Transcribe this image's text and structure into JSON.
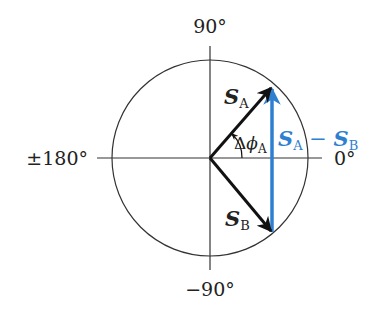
{
  "axes": {
    "top_label": "90°",
    "bottom_label": "−90°",
    "left_label": "±180°",
    "right_label": "0°"
  },
  "vectors": {
    "a": {
      "symbol": "S",
      "subscript": "A",
      "color": "#111111"
    },
    "b": {
      "symbol": "S",
      "subscript": "B",
      "color": "#111111"
    },
    "difference": {
      "symbol_1": "S",
      "subscript_1": "A",
      "operator": " − ",
      "symbol_2": "S",
      "subscript_2": "B",
      "color": "#2f7fd0"
    }
  },
  "angle": {
    "delta": "Δ",
    "phi": "ϕ",
    "subscript": "A"
  }
}
